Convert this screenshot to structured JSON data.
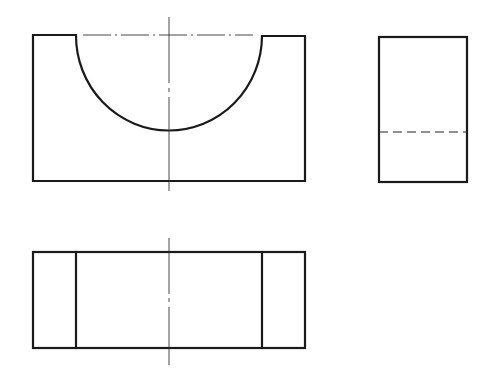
{
  "diagram": {
    "type": "orthographic-projection",
    "views": [
      {
        "name": "front-view",
        "description": "Rectangular block with semicircular cutout from top edge"
      },
      {
        "name": "side-view",
        "description": "Rectangle with hidden line indicating bottom of cutout"
      },
      {
        "name": "top-view",
        "description": "Rectangle with two vertical lines marking cutout edges"
      }
    ],
    "colors": {
      "line": "#1a1a1a",
      "background": "#ffffff"
    },
    "labels": []
  }
}
